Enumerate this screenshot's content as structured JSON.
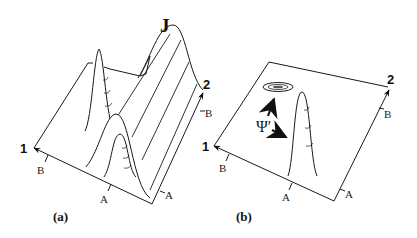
{
  "figure": {
    "panels": [
      {
        "id": "a",
        "caption": "(a)",
        "peak_label": "J",
        "axis_1_label": "1",
        "axis_2_label": "2",
        "tick_labels": {
          "left_axis": "B",
          "front_axis": "A",
          "right_front": "A",
          "right_axis": "B"
        }
      },
      {
        "id": "b",
        "caption": "(b)",
        "annotation": "Ψ′",
        "axis_1_label": "1",
        "axis_2_label": "2",
        "tick_labels": {
          "left_axis": "B",
          "front_axis": "A",
          "right_front": "A",
          "right_axis": "B"
        }
      }
    ],
    "colors": {
      "line": "#1a1a1a",
      "background": "#ffffff"
    }
  }
}
